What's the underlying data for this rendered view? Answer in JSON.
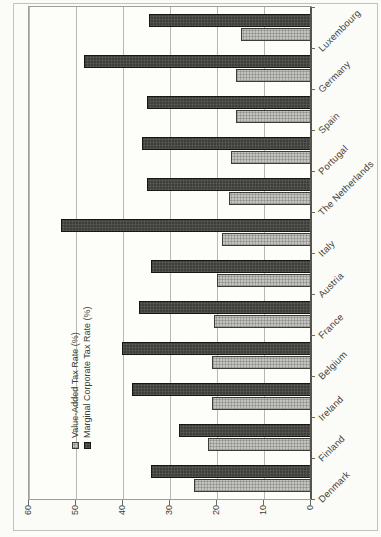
{
  "chart_data": {
    "type": "bar",
    "title": "",
    "categories": [
      "Denmark",
      "Finland",
      "Ireland",
      "Belgium",
      "France",
      "Austria",
      "Italy",
      "The Netherlands",
      "Portugal",
      "Spain",
      "Germany",
      "Luxembourg"
    ],
    "series": [
      {
        "name": "Value-Added Tax Rate (%)",
        "values": [
          25,
          22,
          21,
          21,
          20.6,
          20,
          19,
          17.5,
          17,
          16,
          16,
          15
        ],
        "color": "#c3c3c0",
        "fill_style": "light-checker-pattern"
      },
      {
        "name": "Marginal Corporate Tax Rate (%)",
        "values": [
          34,
          28,
          38,
          40.2,
          36.7,
          34,
          53.2,
          35,
          36,
          35,
          48.4,
          34.5
        ],
        "color": "#3e3e3b",
        "fill_style": "dark-solid-pattern"
      }
    ],
    "xlabel": "",
    "ylabel": "",
    "ylim": [
      0,
      60
    ],
    "yticks": [
      0,
      10,
      20,
      30,
      40,
      50,
      60
    ],
    "grid": true,
    "legend_position": "top-left-inside-plot",
    "category_label_angle_deg": 45,
    "image_orientation": "whole chart rotated 90 degrees counter-clockwise in screenshot"
  }
}
